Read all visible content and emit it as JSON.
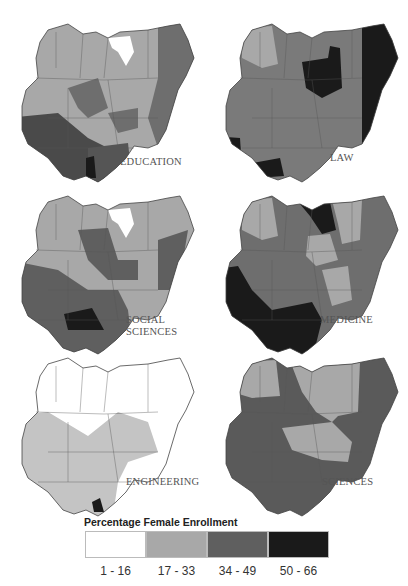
{
  "figure": {
    "legend": {
      "title": "Percentage Female Enrollment",
      "classes": [
        {
          "label": "1 - 16",
          "color": "#ffffff"
        },
        {
          "label": "17 - 33",
          "color": "#a8a8a8"
        },
        {
          "label": "34 - 49",
          "color": "#5f5f5f"
        },
        {
          "label": "50 - 66",
          "color": "#1a1a1a"
        }
      ]
    },
    "panels": [
      {
        "id": "education",
        "label": "EDUCATION",
        "north": "#a8a8a8",
        "northeast": "#6e6e6e",
        "middle": "#a8a8a8",
        "central": "#6e6e6e",
        "southwest": "#4a4a4a",
        "southeast": "#555555",
        "highlight": "#1a1a1a",
        "kano": "#ffffff"
      },
      {
        "id": "law",
        "label": "LAW",
        "north": "#7a7a7a",
        "northeast": "#1a1a1a",
        "middle": "#7a7a7a",
        "central": "#7a7a7a",
        "southwest": "#7a7a7a",
        "southeast": "#7a7a7a",
        "highlight": "#1a1a1a",
        "kano": "#1a1a1a"
      },
      {
        "id": "social-sciences",
        "label": "SOCIAL\nSCIENCES",
        "north": "#a8a8a8",
        "northeast": "#a8a8a8",
        "middle": "#a8a8a8",
        "central": "#5f5f5f",
        "southwest": "#5f5f5f",
        "southeast": "#5f5f5f",
        "highlight": "#1a1a1a",
        "kano": "#ffffff"
      },
      {
        "id": "medicine",
        "label": "MEDICINE",
        "north": "#a8a8a8",
        "northeast": "#7a7a7a",
        "middle": "#6e6e6e",
        "central": "#6e6e6e",
        "southwest": "#1a1a1a",
        "southeast": "#1a1a1a",
        "highlight": "#1a1a1a",
        "kano": "#1a1a1a"
      },
      {
        "id": "engineering",
        "label": "ENGINEERING",
        "north": "#ffffff",
        "northeast": "#ffffff",
        "middle": "#ffffff",
        "central": "#c4c4c4",
        "southwest": "#c4c4c4",
        "southeast": "#c4c4c4",
        "highlight": "#1a1a1a",
        "kano": "#ffffff"
      },
      {
        "id": "sciences",
        "label": "SCIENCES",
        "north": "#a8a8a8",
        "northeast": "#5f5f5f",
        "middle": "#a8a8a8",
        "central": "#a8a8a8",
        "southwest": "#5a5a5a",
        "southeast": "#5a5a5a",
        "highlight": "#5a5a5a",
        "kano": "#a8a8a8"
      }
    ]
  }
}
